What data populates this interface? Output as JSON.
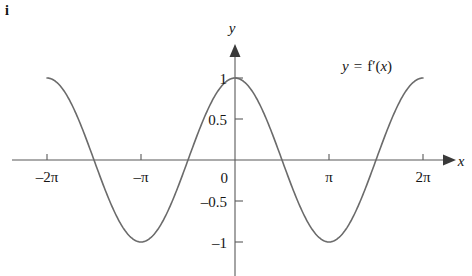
{
  "figure": {
    "part_label": "i",
    "curve_label": {
      "lhs": "y",
      "equals": "=",
      "fn": "f",
      "prime": "′",
      "arg_open": "(",
      "arg": "x",
      "arg_close": ")",
      "full": "y = f′(x)"
    },
    "x_axis_name": "x",
    "y_axis_name": "y"
  },
  "chart_data": {
    "type": "line",
    "title": "",
    "subtitle": "",
    "xlabel": "x",
    "ylabel": "y",
    "legend_position": "inside-top-right",
    "grid": false,
    "annotations": [
      "y = f′(x)"
    ],
    "series": [
      {
        "name": "y = f'(x)",
        "expression": "cos(x)",
        "color": "#6b6b6b",
        "x": [
          -6.2832,
          -5.8905,
          -5.4978,
          -5.1051,
          -4.7124,
          -4.3197,
          -3.927,
          -3.5343,
          -3.1416,
          -2.7489,
          -2.3562,
          -1.9635,
          -1.5708,
          -1.1781,
          -0.7854,
          -0.3927,
          0,
          0.3927,
          0.7854,
          1.1781,
          1.5708,
          1.9635,
          2.3562,
          2.7489,
          3.1416,
          3.5343,
          3.927,
          4.3197,
          4.7124,
          5.1051,
          5.4978,
          5.8905,
          6.2832
        ],
        "y": [
          1,
          0.9239,
          0.7071,
          0.3827,
          0,
          -0.3827,
          -0.7071,
          -0.9239,
          -1,
          -0.9239,
          -0.7071,
          -0.3827,
          0,
          0.3827,
          0.7071,
          0.9239,
          1,
          0.9239,
          0.7071,
          0.3827,
          0,
          -0.3827,
          -0.7071,
          -0.9239,
          -1,
          -0.9239,
          -0.7071,
          -0.3827,
          0,
          0.3827,
          0.7071,
          0.9239,
          1
        ]
      }
    ],
    "xlim": [
      -6.2832,
      6.2832
    ],
    "ylim": [
      -1.15,
      1.2
    ],
    "x_ticks": [
      {
        "value": -6.2832,
        "label": "–2π"
      },
      {
        "value": -3.1416,
        "label": "–π"
      },
      {
        "value": 3.1416,
        "label": "π"
      },
      {
        "value": 6.2832,
        "label": "2π"
      }
    ],
    "y_ticks": [
      {
        "value": 1,
        "label": "1"
      },
      {
        "value": 0.5,
        "label": "0.5"
      },
      {
        "value": 0,
        "label": "0"
      },
      {
        "value": -0.5,
        "label": "–0.5"
      },
      {
        "value": -1,
        "label": "–1"
      }
    ],
    "extrema": [
      {
        "x": -6.2832,
        "y": 1,
        "kind": "maximum"
      },
      {
        "x": -3.1416,
        "y": -1,
        "kind": "minimum"
      },
      {
        "x": 0,
        "y": 1,
        "kind": "maximum"
      },
      {
        "x": 3.1416,
        "y": -1,
        "kind": "minimum"
      },
      {
        "x": 6.2832,
        "y": 1,
        "kind": "maximum"
      }
    ],
    "zeros": [
      -4.7124,
      -1.5708,
      1.5708,
      4.7124
    ]
  }
}
